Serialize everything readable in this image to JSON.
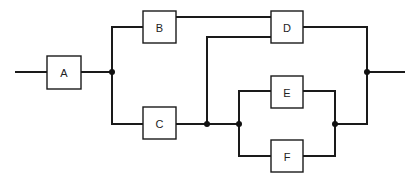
{
  "diagram": {
    "type": "reliability-block-diagram",
    "blocks": [
      {
        "id": "A",
        "label": "A"
      },
      {
        "id": "B",
        "label": "B"
      },
      {
        "id": "C",
        "label": "C"
      },
      {
        "id": "D",
        "label": "D"
      },
      {
        "id": "E",
        "label": "E"
      },
      {
        "id": "F",
        "label": "F"
      }
    ],
    "connections": [
      [
        "input",
        "A"
      ],
      [
        "A",
        "B"
      ],
      [
        "A",
        "C"
      ],
      [
        "B",
        "D"
      ],
      [
        "C",
        "D"
      ],
      [
        "C",
        "E"
      ],
      [
        "C",
        "F"
      ],
      [
        "E",
        "output"
      ],
      [
        "F",
        "output"
      ],
      [
        "D",
        "output"
      ]
    ]
  }
}
